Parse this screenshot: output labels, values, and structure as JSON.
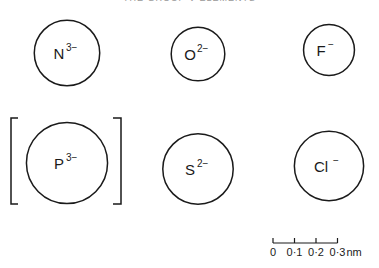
{
  "title": "THE GROUP V ELEMENTS",
  "ions": [
    {
      "symbol": "N",
      "charge": "3−",
      "radius_nm": 0.171
    },
    {
      "symbol": "O",
      "charge": "2−",
      "radius_nm": 0.14
    },
    {
      "symbol": "F",
      "charge": "−",
      "radius_nm": 0.133
    },
    {
      "symbol": "P",
      "charge": "3−",
      "radius_nm": 0.212,
      "bracketed": true
    },
    {
      "symbol": "S",
      "charge": "2−",
      "radius_nm": 0.184
    },
    {
      "symbol": "Cl",
      "charge": "−",
      "radius_nm": 0.181
    }
  ],
  "scale_bar": {
    "ticks": [
      "0",
      "0·1",
      "0·2",
      "0·3"
    ],
    "unit": "nm"
  }
}
